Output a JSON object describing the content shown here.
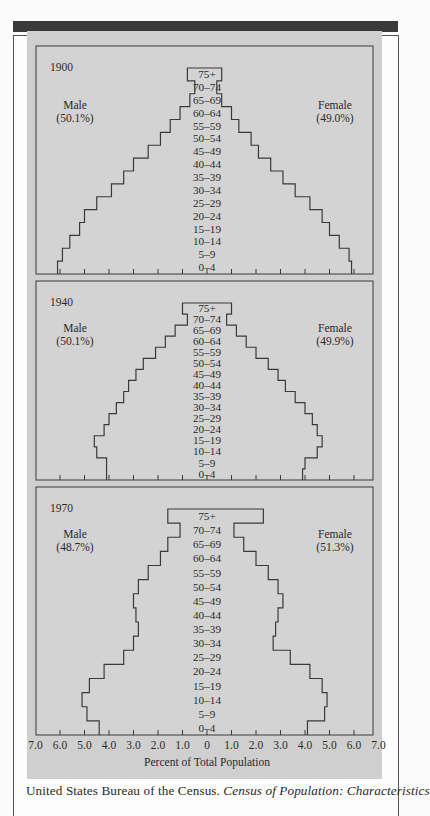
{
  "figure": {
    "xlabel": "Percent of Total Population",
    "x_tick_labels": [
      "7.0",
      "6.0",
      "5.0",
      "4.0",
      "3.0",
      "2.0",
      "1.0",
      "0",
      "1.0",
      "2.0",
      "3.0",
      "4.0",
      "5.0",
      "6.0",
      "7.0"
    ]
  },
  "caption": {
    "text_plain": "United States Bureau of the Census. ",
    "text_italic": "Census of Population: Characteristics"
  },
  "chart_data": {
    "type": "bar",
    "subtype": "population-pyramid",
    "xlabel": "Percent of Total Population",
    "xlim": [
      -7.0,
      7.0
    ],
    "categories": [
      "0-4",
      "5-9",
      "10-14",
      "15-19",
      "20-24",
      "25-29",
      "30-34",
      "35-39",
      "40-44",
      "45-49",
      "50-54",
      "55-59",
      "60-64",
      "65-69",
      "70-74",
      "75+"
    ],
    "panels": [
      {
        "title": "1900",
        "male_label": "Male",
        "male_share": "(50.1%)",
        "female_label": "Female",
        "female_share": "(49.0%)",
        "series": [
          {
            "name": "Male",
            "values": [
              6.1,
              5.9,
              5.6,
              5.2,
              5.0,
              4.5,
              3.9,
              3.4,
              3.0,
              2.4,
              1.9,
              1.5,
              1.1,
              0.7,
              0.5,
              0.8
            ]
          },
          {
            "name": "Female",
            "values": [
              5.9,
              5.8,
              5.4,
              5.0,
              4.7,
              4.2,
              3.6,
              3.1,
              2.6,
              2.1,
              1.8,
              1.3,
              1.0,
              0.6,
              0.4,
              0.6
            ]
          }
        ]
      },
      {
        "title": "1940",
        "male_label": "Male",
        "male_share": "(50.1%)",
        "female_label": "Female",
        "female_share": "(49.9%)",
        "series": [
          {
            "name": "Male",
            "values": [
              4.1,
              4.1,
              4.5,
              4.6,
              4.2,
              4.0,
              3.7,
              3.4,
              3.2,
              2.9,
              2.6,
              2.1,
              1.7,
              1.3,
              0.8,
              1.0
            ]
          },
          {
            "name": "Female",
            "values": [
              3.9,
              4.0,
              4.5,
              4.7,
              4.5,
              4.3,
              4.0,
              3.6,
              3.2,
              2.9,
              2.5,
              2.0,
              1.6,
              1.2,
              0.8,
              1.0
            ]
          }
        ]
      },
      {
        "title": "1970",
        "male_label": "Male",
        "male_share": "(48.7%)",
        "female_label": "Female",
        "female_share": "(51.3%)",
        "series": [
          {
            "name": "Male",
            "values": [
              4.4,
              4.9,
              5.1,
              4.8,
              4.2,
              3.4,
              3.0,
              2.8,
              2.9,
              3.0,
              2.8,
              2.4,
              1.9,
              1.6,
              1.1,
              1.6
            ]
          },
          {
            "name": "Female",
            "values": [
              4.1,
              4.8,
              4.9,
              4.7,
              4.2,
              3.4,
              2.7,
              2.8,
              2.9,
              3.1,
              2.9,
              2.5,
              2.0,
              1.5,
              1.1,
              2.3
            ]
          }
        ]
      }
    ]
  }
}
